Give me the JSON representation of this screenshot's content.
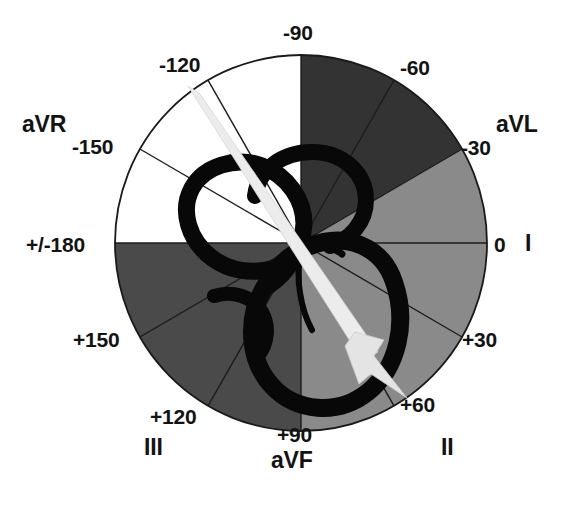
{
  "diagram": {
    "type": "polar-sector-diagram",
    "center": {
      "x": 301,
      "y": 243
    },
    "radius": 186,
    "degree_labels": [
      {
        "id": "deg-minus-90",
        "text": "-90",
        "angle": -90,
        "x": 283,
        "y": 22
      },
      {
        "id": "deg-minus-120",
        "text": "-120",
        "angle": -120,
        "x": 159,
        "y": 54
      },
      {
        "id": "deg-minus-150",
        "text": "-150",
        "angle": -150,
        "x": 72,
        "y": 136
      },
      {
        "id": "deg-pm-180",
        "text": "+/-180",
        "angle": 180,
        "x": 26,
        "y": 234
      },
      {
        "id": "deg-plus-150",
        "text": "+150",
        "angle": 150,
        "x": 73,
        "y": 329
      },
      {
        "id": "deg-plus-120",
        "text": "+120",
        "angle": 120,
        "x": 150,
        "y": 406
      },
      {
        "id": "deg-plus-90",
        "text": "+90",
        "angle": 90,
        "x": 277,
        "y": 424
      },
      {
        "id": "deg-plus-60",
        "text": "+60",
        "angle": 60,
        "x": 400,
        "y": 394
      },
      {
        "id": "deg-plus-30",
        "text": "+30",
        "angle": 30,
        "x": 462,
        "y": 329
      },
      {
        "id": "deg-zero",
        "text": "0",
        "angle": 0,
        "x": 494,
        "y": 234
      },
      {
        "id": "deg-minus-30",
        "text": "-30",
        "angle": -30,
        "x": 461,
        "y": 137
      },
      {
        "id": "deg-minus-60",
        "text": "-60",
        "angle": -60,
        "x": 400,
        "y": 57
      }
    ],
    "lead_labels": [
      {
        "id": "lead-aVR",
        "text": "aVR",
        "x": 22,
        "y": 113
      },
      {
        "id": "lead-aVL",
        "text": "aVL",
        "x": 496,
        "y": 113
      },
      {
        "id": "lead-I",
        "text": "I",
        "x": 525,
        "y": 232
      },
      {
        "id": "lead-II",
        "text": "II",
        "x": 441,
        "y": 436
      },
      {
        "id": "lead-aVF",
        "text": "aVF",
        "x": 271,
        "y": 449
      },
      {
        "id": "lead-III",
        "text": "III",
        "x": 144,
        "y": 436
      }
    ],
    "sectors": [
      {
        "id": "sector-white-upper-left",
        "from": 180,
        "to": -90,
        "fill": "#ffffff",
        "label": "left-superior-white"
      },
      {
        "id": "sector-dark-upper-right",
        "from": -90,
        "to": -30,
        "fill": "#333333",
        "label": "superior-right-very-dark"
      },
      {
        "id": "sector-mid-right",
        "from": -30,
        "to": 90,
        "fill": "#8a8a8a",
        "label": "right-inferior-medium-gray"
      },
      {
        "id": "sector-dark-lower-left",
        "from": 90,
        "to": 180,
        "fill": "#4a4a4a",
        "label": "left-inferior-dark-gray"
      }
    ],
    "spoke_angles": [
      -60,
      -30,
      0,
      30,
      60,
      120,
      150,
      180,
      -150,
      -120
    ],
    "colors": {
      "white_sector": "#ffffff",
      "very_dark_sector": "#333333",
      "medium_gray_sector": "#8a8a8a",
      "dark_gray_sector": "#4a4a4a",
      "outline": "#1a1a1a",
      "heart_stroke": "#080808",
      "arrow_fill": "#e8e8e8",
      "text": "#131313"
    },
    "axis_arrow": {
      "id": "mean-qrs-axis-arrow",
      "tail_angle": -120,
      "head_angle": 60,
      "tail_point": {
        "x": 194,
        "y": 89
      },
      "head_point": {
        "x": 406,
        "y": 396
      },
      "description": "light gray tapered arrow indicating mean QRS axis at +60 degrees"
    },
    "heart": {
      "id": "heart-outline",
      "description": "black line-art outline of the heart overlaying the circle center"
    }
  }
}
